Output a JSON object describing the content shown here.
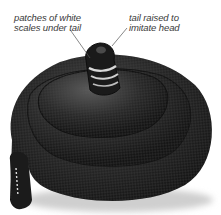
{
  "image": {
    "subject": "coiled black snake with raised tail imitating a head",
    "annotations": [
      {
        "id": "white-scales",
        "lines": [
          "patches of white",
          "scales under tail"
        ]
      },
      {
        "id": "tail-raised",
        "lines": [
          "tail raised to",
          "imitate head"
        ]
      }
    ],
    "colors": {
      "snake_body": "#1e1e1e",
      "snake_highlight": "#5a5a5a",
      "label_text": "#3a3a3a",
      "leader_line": "#555555",
      "background": "#ffffff"
    }
  }
}
